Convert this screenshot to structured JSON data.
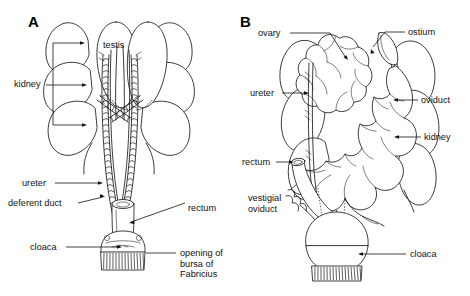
{
  "figure": {
    "background_color": "#ffffff",
    "line_color": "#1a1a1a",
    "width": 470,
    "height": 296
  },
  "panels": [
    {
      "id": "A",
      "letter": "A",
      "subject": "male",
      "labels": [
        {
          "name": "testis",
          "text": "testis",
          "x": 103,
          "y": 48,
          "anchor": "start"
        },
        {
          "name": "kidney",
          "text": "kidney",
          "x": 14,
          "y": 87,
          "anchor": "start"
        },
        {
          "name": "ureter",
          "text": "ureter",
          "x": 22,
          "y": 186,
          "anchor": "start"
        },
        {
          "name": "deferent-duct",
          "text": "deferent duct",
          "x": 8,
          "y": 206,
          "anchor": "start"
        },
        {
          "name": "cloaca",
          "text": "cloaca",
          "x": 30,
          "y": 250,
          "anchor": "start"
        },
        {
          "name": "rectum",
          "text": "rectum",
          "x": 188,
          "y": 211,
          "anchor": "start"
        }
      ],
      "multiline_labels": [
        {
          "name": "opening-of-bursa-of-fabricius",
          "lines": [
            "opening of",
            "bursa of",
            "Fabricius"
          ],
          "x": 180,
          "y": 256,
          "line_height": 10.5,
          "anchor": "start"
        }
      ]
    },
    {
      "id": "B",
      "letter": "B",
      "subject": "female",
      "labels": [
        {
          "name": "ovary",
          "text": "ovary",
          "x": 258,
          "y": 36,
          "anchor": "start"
        },
        {
          "name": "ostium",
          "text": "ostium",
          "x": 408,
          "y": 35,
          "anchor": "start"
        },
        {
          "name": "ureter",
          "text": "ureter",
          "x": 250,
          "y": 96,
          "anchor": "start"
        },
        {
          "name": "oviduct",
          "text": "oviduct",
          "x": 421,
          "y": 103,
          "anchor": "start"
        },
        {
          "name": "kidney",
          "text": "kidney",
          "x": 424,
          "y": 140,
          "anchor": "start"
        },
        {
          "name": "rectum",
          "text": "rectum",
          "x": 242,
          "y": 165,
          "anchor": "start"
        },
        {
          "name": "cloaca",
          "text": "cloaca",
          "x": 410,
          "y": 257,
          "anchor": "start"
        }
      ],
      "multiline_labels": [
        {
          "name": "vestigial-oviduct",
          "lines": [
            "vestigial",
            "oviduct"
          ],
          "x": 248,
          "y": 201,
          "line_height": 11,
          "anchor": "start"
        }
      ]
    }
  ]
}
